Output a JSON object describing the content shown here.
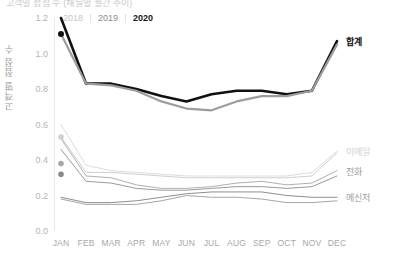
{
  "title": "고객별 접점 수 (채널별 월간 추이)",
  "legend": {
    "items": [
      {
        "label": "2018",
        "color": "#c6c6c6"
      },
      {
        "label": "2019",
        "color": "#8c8c8c"
      },
      {
        "label": "2020",
        "color": "#151515"
      }
    ]
  },
  "axes": {
    "ylabel": "고객별 접점 수",
    "yticks": [
      "1.2",
      "1.0",
      "0.8",
      "0.6",
      "0.4",
      "0.2",
      "0.0"
    ],
    "ylim": [
      0.0,
      1.2
    ],
    "xticks": [
      "JAN",
      "FEB",
      "MAR",
      "APR",
      "MAY",
      "JUN",
      "JUL",
      "AUG",
      "SEP",
      "OCT",
      "NOV",
      "DEC"
    ]
  },
  "series_labels": {
    "total": "합계",
    "email": "이메일",
    "phone": "전화",
    "messenger": "메신저"
  },
  "colors": {
    "y2018": "#c6c6c6",
    "y2019": "#9d9d9d",
    "y2020": "#111111",
    "grid": "#e8e8e8",
    "tick": "#b4b4b4"
  },
  "chart_data": {
    "type": "line",
    "title": "고객별 접점 수 (채널별 월간 추이)",
    "xlabel": "",
    "ylabel": "고객별 접점 수",
    "ylim": [
      0.0,
      1.2
    ],
    "grid": false,
    "legend_position": "top-left",
    "categories": [
      "JAN",
      "FEB",
      "MAR",
      "APR",
      "MAY",
      "JUN",
      "JUL",
      "AUG",
      "SEP",
      "OCT",
      "NOV",
      "DEC"
    ],
    "groups": [
      {
        "name": "합계",
        "label_side": "right",
        "series": [
          {
            "name": "2020",
            "color": "#111111",
            "width": 2.6,
            "values": [
              1.2,
              0.83,
              0.83,
              0.8,
              0.76,
              0.73,
              0.77,
              0.79,
              0.79,
              0.77,
              0.79,
              1.07
            ]
          },
          {
            "name": "2019",
            "color": "#9d9d9d",
            "width": 2.2,
            "values": [
              1.11,
              0.83,
              0.82,
              0.79,
              0.73,
              0.69,
              0.68,
              0.73,
              0.76,
              0.76,
              0.79,
              1.05
            ]
          }
        ]
      },
      {
        "name": "이메일",
        "label_side": "right",
        "series": [
          {
            "name": "2018",
            "color": "#dcdcdc",
            "width": 1.0,
            "values": [
              0.6,
              0.37,
              0.34,
              0.33,
              0.32,
              0.31,
              0.31,
              0.31,
              0.31,
              0.31,
              0.33,
              0.45
            ]
          },
          {
            "name": "2019",
            "color": "#cfcfcf",
            "width": 1.0,
            "values": [
              0.53,
              0.33,
              0.33,
              0.32,
              0.31,
              0.3,
              0.3,
              0.3,
              0.3,
              0.3,
              0.31,
              0.44
            ]
          }
        ]
      },
      {
        "name": "전화",
        "label_side": "right",
        "series": [
          {
            "name": "2018",
            "color": "#b0b0b0",
            "width": 1.0,
            "values": [
              0.52,
              0.31,
              0.3,
              0.26,
              0.24,
              0.24,
              0.25,
              0.27,
              0.28,
              0.26,
              0.27,
              0.34
            ]
          },
          {
            "name": "2019",
            "color": "#9a9a9a",
            "width": 1.0,
            "values": [
              0.46,
              0.28,
              0.27,
              0.24,
              0.23,
              0.23,
              0.24,
              0.25,
              0.25,
              0.24,
              0.25,
              0.31
            ]
          }
        ]
      },
      {
        "name": "메신저",
        "label_side": "right",
        "series": [
          {
            "name": "2018",
            "color": "#8e8e8e",
            "width": 1.0,
            "values": [
              0.19,
              0.16,
              0.16,
              0.17,
              0.19,
              0.21,
              0.22,
              0.22,
              0.22,
              0.2,
              0.19,
              0.19
            ]
          },
          {
            "name": "2019",
            "color": "#a6a6a6",
            "width": 1.0,
            "values": [
              0.18,
              0.15,
              0.15,
              0.15,
              0.17,
              0.2,
              0.19,
              0.19,
              0.18,
              0.16,
              0.16,
              0.17
            ]
          }
        ]
      }
    ],
    "markers": [
      {
        "x": "JAN",
        "y": 1.11,
        "color": "#111111",
        "r": 3.0
      },
      {
        "x": "JAN",
        "y": 0.53,
        "color": "#d0d0d0",
        "r": 2.8
      },
      {
        "x": "JAN",
        "y": 0.38,
        "color": "#a8a8a8",
        "r": 2.8
      },
      {
        "x": "JAN",
        "y": 0.32,
        "color": "#8a8a8a",
        "r": 2.8
      }
    ]
  }
}
